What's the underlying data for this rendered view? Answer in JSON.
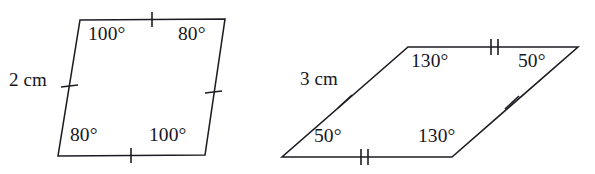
{
  "figure": {
    "background_color": "#ffffff",
    "stroke_color": "#1c1c22",
    "text_color": "#16161c",
    "shapes": [
      {
        "name": "left-parallelogram",
        "side_length_label": "2 cm",
        "angles": {
          "top_left": "100°",
          "top_right": "80°",
          "bottom_left": "80°",
          "bottom_right": "100°"
        },
        "tick_counts": {
          "top_edge": 1,
          "bottom_edge": 1,
          "left_edge": 1,
          "right_edge": 1
        },
        "vertices": {
          "top_left": [
            80,
            20
          ],
          "top_right": [
            225,
            19
          ],
          "bottom_right": [
            205,
            155
          ],
          "bottom_left": [
            58,
            156
          ]
        }
      },
      {
        "name": "right-parallelogram",
        "side_length_label": "3 cm",
        "angles": {
          "top_left": "130°",
          "top_right": "50°",
          "bottom_left": "50°",
          "bottom_right": "130°"
        },
        "tick_counts": {
          "top_edge": 2,
          "bottom_edge": 2,
          "left_edge": 1,
          "right_edge": 1
        },
        "vertices": {
          "top_left": [
            408,
            47
          ],
          "top_right": [
            578,
            47
          ],
          "bottom_right": [
            452,
            157
          ],
          "bottom_left": [
            282,
            157
          ]
        }
      }
    ]
  },
  "labels": {
    "left_shape": {
      "angle_top_left": "100°",
      "angle_top_right": "80°",
      "angle_bottom_left": "80°",
      "angle_bottom_right": "100°",
      "side": "2 cm"
    },
    "right_shape": {
      "angle_top_left": "130°",
      "angle_top_right": "50°",
      "angle_bottom_left": "50°",
      "angle_bottom_right": "130°",
      "side": "3 cm"
    }
  }
}
